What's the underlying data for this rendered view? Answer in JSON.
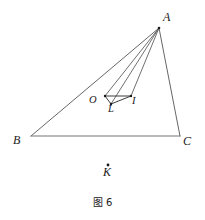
{
  "figure": {
    "caption": "图 6",
    "background_color": "#ffffff",
    "line_color": "#555555",
    "text_color": "#1a1a1a",
    "width": 205,
    "height": 220,
    "points": {
      "A": {
        "label": "A",
        "x": 159,
        "y": 28
      },
      "B": {
        "label": "B",
        "x": 31,
        "y": 136
      },
      "C": {
        "label": "C",
        "x": 180,
        "y": 136
      },
      "O": {
        "label": "O",
        "x": 105,
        "y": 96
      },
      "L": {
        "label": "L",
        "x": 111,
        "y": 104
      },
      "I": {
        "label": "I",
        "x": 131,
        "y": 96
      },
      "K": {
        "label": "K",
        "x": 108,
        "y": 165
      }
    },
    "segments": [
      {
        "name": "AB",
        "from": "A",
        "to": "B"
      },
      {
        "name": "BC",
        "from": "B",
        "to": "C"
      },
      {
        "name": "CA",
        "from": "C",
        "to": "A"
      },
      {
        "name": "AO",
        "from": "A",
        "to": "O"
      },
      {
        "name": "AL",
        "from": "A",
        "to": "L"
      },
      {
        "name": "AI",
        "from": "A",
        "to": "I"
      },
      {
        "name": "OL",
        "from": "O",
        "to": "L"
      },
      {
        "name": "LI",
        "from": "L",
        "to": "I"
      },
      {
        "name": "OI",
        "from": "O",
        "to": "I"
      }
    ],
    "dots": [
      {
        "name": "K-dot",
        "x": 108,
        "y": 165
      }
    ]
  }
}
